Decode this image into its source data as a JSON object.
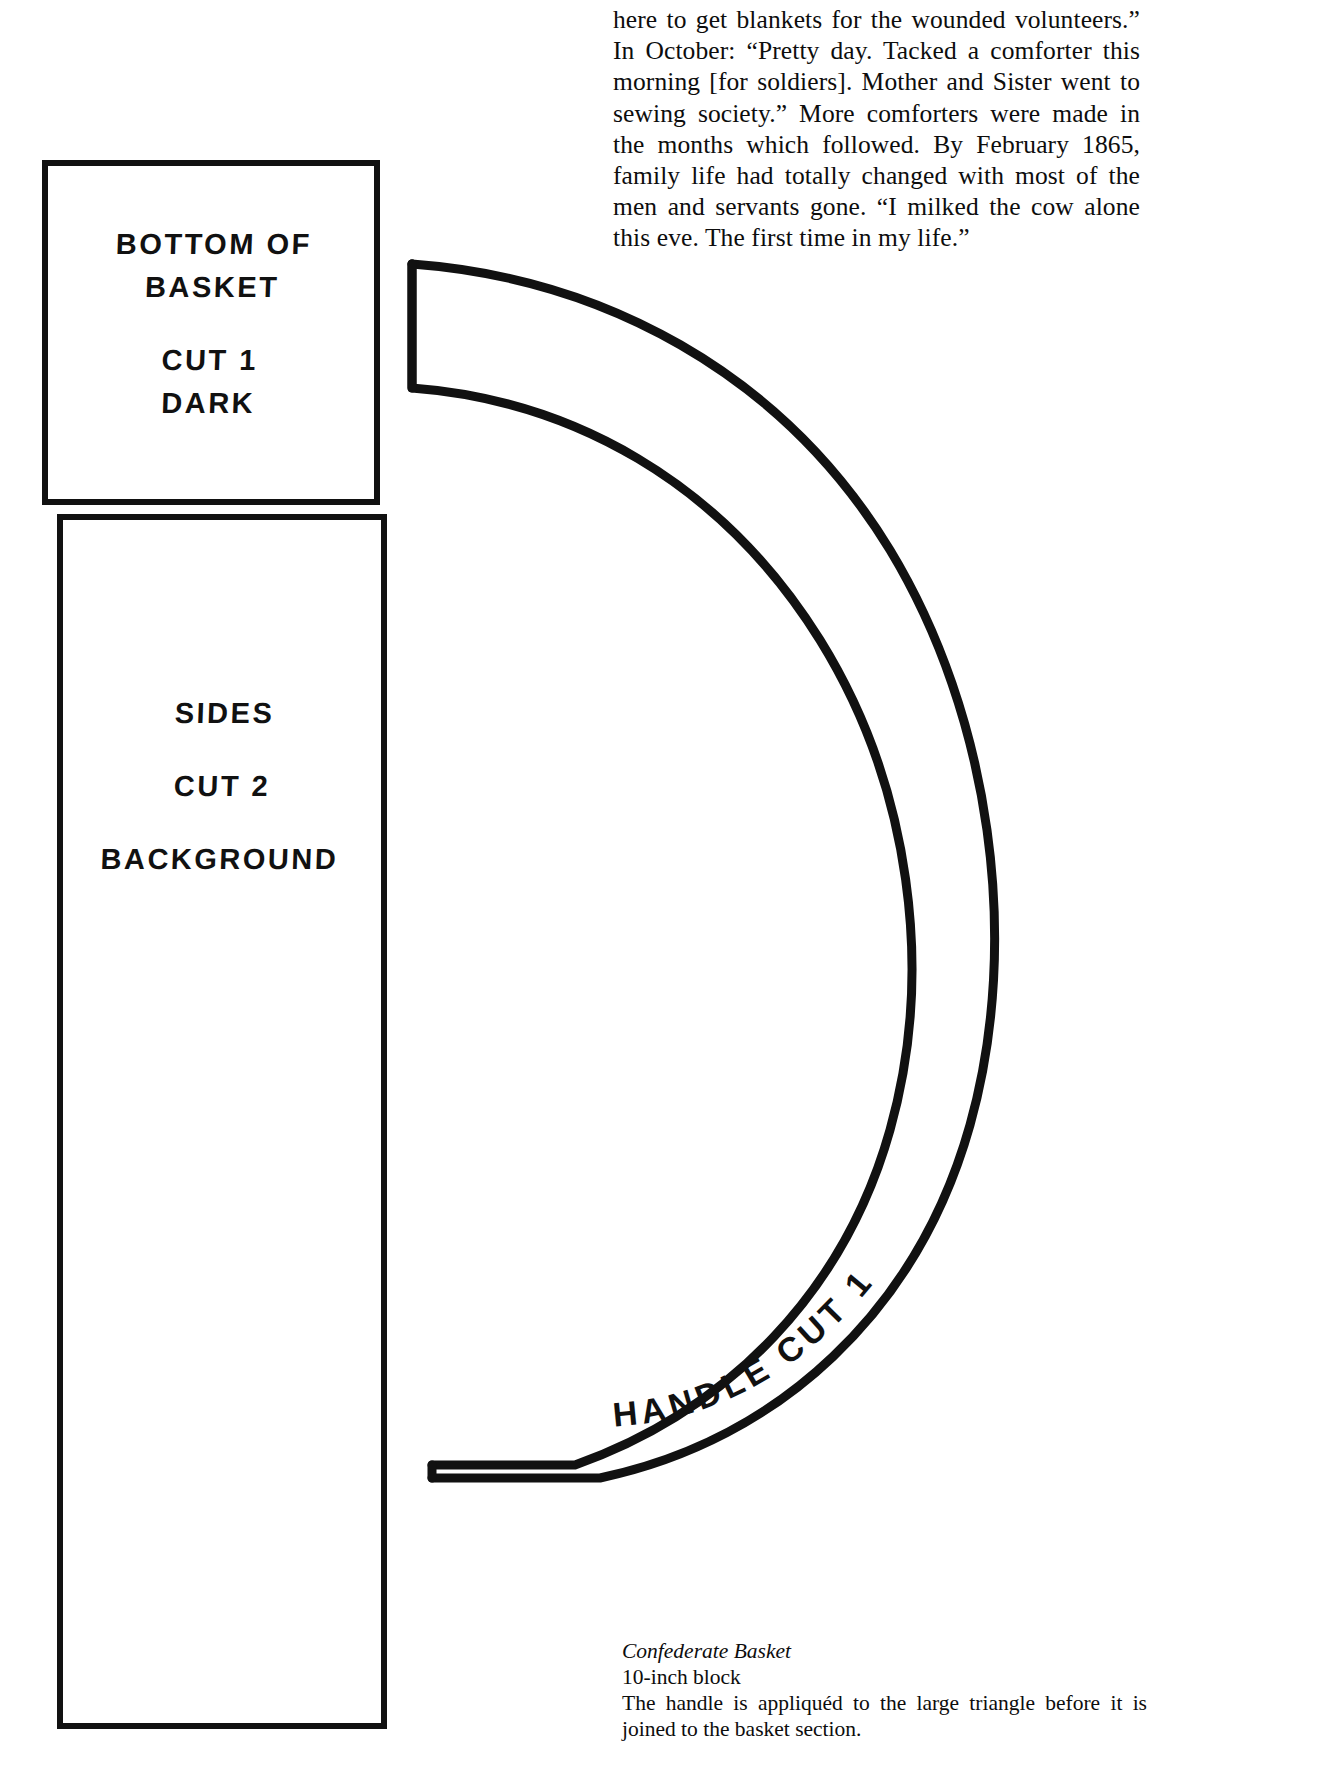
{
  "page": {
    "background_color": "#ffffff",
    "ink_color": "#111111"
  },
  "body_text": {
    "paragraph": "here to get blankets for the wounded volunteers.” In October: “Pretty day. Tacked a comforter this morning [for soldiers]. Mother and Sister went to sewing society.” More comforters were made in the months which followed. By February 1865, family life had totally changed with most of the men and servants gone. “I milked the cow alone this eve. The first time in my life.”"
  },
  "caption": {
    "title": "Confederate Basket",
    "subtitle": "10-inch block",
    "note": "The handle is appliquéd to the large triangle before it is joined to the basket section."
  },
  "pattern_pieces": [
    {
      "id": "bottom-of-basket",
      "shape": "square",
      "labels": [
        "BOTTOM OF",
        "BASKET",
        "CUT 1",
        "DARK"
      ]
    },
    {
      "id": "sides",
      "shape": "rectangle",
      "labels": [
        "SIDES",
        "CUT 2",
        "BACKGROUND"
      ]
    },
    {
      "id": "handle",
      "shape": "arc",
      "labels": [
        "HANDLE",
        "CUT 1"
      ]
    }
  ],
  "piece_bottom": {
    "line1": "BOTTOM OF",
    "line2": "BASKET",
    "line3": "CUT 1",
    "line4": "DARK"
  },
  "piece_sides": {
    "line1": "SIDES",
    "line2": "CUT 2",
    "line3": "BACKGROUND"
  },
  "piece_handle": {
    "word1": "HANDLE",
    "word2": "CUT 1",
    "combined": "HANDLE   CUT 1"
  }
}
